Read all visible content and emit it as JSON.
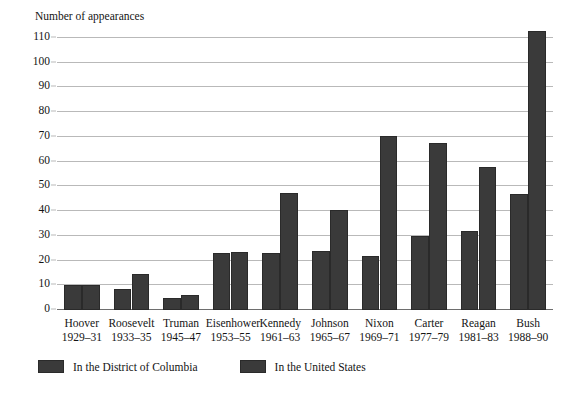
{
  "axis_title": "Number of appearances",
  "top_cutoff_artifact": "",
  "chart_data": {
    "type": "bar",
    "title": "",
    "subtitle": "",
    "xlabel": "",
    "ylabel": "Number of appearances",
    "ylim": [
      0,
      110
    ],
    "ytick_step": 10,
    "yticks": [
      0,
      10,
      20,
      30,
      40,
      50,
      60,
      70,
      80,
      90,
      100,
      110
    ],
    "grid": "horizontal",
    "legend_position": "bottom-left",
    "bar_color": "#3a3a3a",
    "categories": [
      "Hoover",
      "Roosevelt",
      "Truman",
      "Eisenhower",
      "Kennedy",
      "Johnson",
      "Nixon",
      "Carter",
      "Reagan",
      "Bush"
    ],
    "category_years": [
      "1929–31",
      "1933–35",
      "1945–47",
      "1953–55",
      "1961–63",
      "1965–67",
      "1969–71",
      "1977–79",
      "1981–83",
      "1988–90"
    ],
    "series": [
      {
        "name": "In the District of Columbia",
        "values": [
          10,
          8.5,
          5,
          23,
          23,
          24,
          22,
          30,
          32,
          47
        ]
      },
      {
        "name": "In the United States",
        "values": [
          10,
          14.5,
          6,
          23.5,
          47.5,
          40.5,
          70.5,
          67.5,
          58,
          113
        ]
      }
    ]
  },
  "legend": [
    {
      "label": "In the District of Columbia"
    },
    {
      "label": "In the United States"
    }
  ]
}
